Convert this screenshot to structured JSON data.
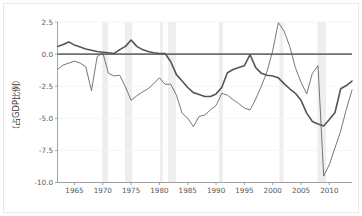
{
  "figure": {
    "background_color": "#ffffff",
    "border_color": "#e8e8e8",
    "axis_color": "#8a8a8a",
    "grid_color": "#f2f2f2",
    "recession_band_color": "#eeeeee",
    "zero_line_color": "#6f6f6f"
  },
  "chart_data": {
    "type": "line",
    "title": "",
    "subtitle": "",
    "xlabel": "",
    "ylabel": "（占GDP比例）",
    "xlim": [
      1962,
      2014
    ],
    "ylim": [
      -10.0,
      2.5
    ],
    "grid": true,
    "legend_position": "none",
    "xticks": [
      1965,
      1970,
      1975,
      1980,
      1985,
      1990,
      1995,
      2000,
      2005,
      2010
    ],
    "xticklabels": [
      "1965",
      "1970",
      "1975",
      "1980",
      "1985",
      "1990",
      "1995",
      "2000",
      "2005",
      "2010"
    ],
    "yticks": [
      2.5,
      0.0,
      -2.5,
      -5.0,
      -7.5,
      -10.0
    ],
    "yticklabels": [
      "2.5",
      "0.0",
      "-2.5",
      "-5.0",
      "-7.5",
      "-10.0"
    ],
    "reference_lines": [
      {
        "name": "zero-reference",
        "orientation": "horizontal",
        "y": 0.0,
        "color": "#6f6f6f",
        "width": 1.7
      }
    ],
    "shaded_regions": [
      {
        "name": "recession-1970",
        "x_start": 1969.9,
        "x_end": 1970.9,
        "color": "#eeeeee"
      },
      {
        "name": "recession-1974",
        "x_start": 1973.9,
        "x_end": 1975.2,
        "color": "#eeeeee"
      },
      {
        "name": "recession-1980",
        "x_start": 1980.1,
        "x_end": 1980.6,
        "color": "#eeeeee"
      },
      {
        "name": "recession-1981",
        "x_start": 1981.5,
        "x_end": 1982.9,
        "color": "#eeeeee"
      },
      {
        "name": "recession-1990",
        "x_start": 1990.5,
        "x_end": 1991.2,
        "color": "#eeeeee"
      },
      {
        "name": "recession-2001",
        "x_start": 2001.2,
        "x_end": 2001.9,
        "color": "#eeeeee"
      },
      {
        "name": "recession-2008",
        "x_start": 2007.9,
        "x_end": 2009.4,
        "color": "#eeeeee"
      }
    ],
    "x": [
      1962,
      1963,
      1964,
      1965,
      1966,
      1967,
      1968,
      1969,
      1970,
      1971,
      1972,
      1973,
      1974,
      1975,
      1976,
      1977,
      1978,
      1979,
      1980,
      1981,
      1982,
      1983,
      1984,
      1985,
      1986,
      1987,
      1988,
      1989,
      1990,
      1991,
      1992,
      1993,
      1994,
      1995,
      1996,
      1997,
      1998,
      1999,
      2000,
      2001,
      2002,
      2003,
      2004,
      2005,
      2006,
      2007,
      2008,
      2009,
      2010,
      2011,
      2012,
      2013,
      2014
    ],
    "series": [
      {
        "name": "thick-series",
        "color": "#555555",
        "width": 1.6,
        "values": [
          0.6,
          0.75,
          0.95,
          0.7,
          0.55,
          0.4,
          0.3,
          0.2,
          0.15,
          0.1,
          0.05,
          0.35,
          0.6,
          1.1,
          0.6,
          0.35,
          0.2,
          0.1,
          0.05,
          0.05,
          -0.6,
          -1.6,
          -2.1,
          -2.6,
          -3.0,
          -3.15,
          -3.3,
          -3.3,
          -3.1,
          -2.6,
          -1.45,
          -1.2,
          -1.05,
          -0.9,
          -0.05,
          -1.05,
          -1.5,
          -1.65,
          -1.7,
          -1.85,
          -2.3,
          -2.7,
          -3.05,
          -3.6,
          -4.6,
          -5.25,
          -5.45,
          -5.6,
          -5.1,
          -4.55,
          -2.7,
          -2.45,
          -2.1
        ]
      },
      {
        "name": "thin-series",
        "color": "#5f5f5f",
        "width": 0.85,
        "values": [
          -1.2,
          -0.85,
          -0.7,
          -0.55,
          -0.7,
          -1.0,
          -2.85,
          -0.2,
          0.1,
          -1.5,
          -1.7,
          -1.65,
          -2.55,
          -3.6,
          -3.25,
          -2.95,
          -2.7,
          -2.3,
          -1.85,
          -2.35,
          -2.35,
          -3.2,
          -4.6,
          -5.0,
          -5.65,
          -4.85,
          -4.75,
          -4.35,
          -4.0,
          -3.05,
          -3.2,
          -3.55,
          -3.85,
          -4.2,
          -4.35,
          -3.5,
          -2.5,
          -1.35,
          0.25,
          2.45,
          1.8,
          0.6,
          -1.05,
          -2.2,
          -3.1,
          -1.5,
          -0.9,
          -9.5,
          -8.6,
          -7.3,
          -6.0,
          -4.3,
          -2.8
        ]
      }
    ]
  }
}
